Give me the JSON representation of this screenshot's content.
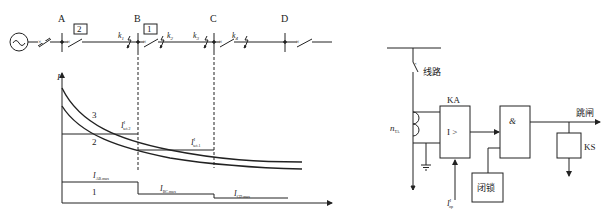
{
  "left_diagram": {
    "buses": [
      {
        "label": "A"
      },
      {
        "label": "B"
      },
      {
        "label": "C"
      },
      {
        "label": "D"
      }
    ],
    "protection_boxes": [
      {
        "label": "2"
      },
      {
        "label": "1"
      }
    ],
    "fault_points": [
      {
        "label": "k",
        "sub": "1"
      },
      {
        "label": "k",
        "sub": "2"
      },
      {
        "label": "k",
        "sub": "3"
      },
      {
        "label": "k",
        "sub": "4"
      }
    ],
    "source_symbol": "~",
    "y_axis_label": "I",
    "curves": [
      {
        "label": "3"
      },
      {
        "label": "2"
      },
      {
        "label": "1"
      }
    ],
    "settings": [
      {
        "label": "I",
        "sup": "I",
        "sub": "set.2"
      },
      {
        "label": "I",
        "sup": "I",
        "sub": "set.1"
      }
    ],
    "load_currents": [
      {
        "label": "I",
        "sub": "AB.max"
      },
      {
        "label": "I",
        "sub": "BC.max"
      },
      {
        "label": "I",
        "sub": "CD.max"
      }
    ]
  },
  "right_diagram": {
    "line_label": "线路",
    "ct_label": "n",
    "ct_sub": "TA",
    "relay_label": "KA",
    "relay_symbol": "I >",
    "and_symbol": "&",
    "trip_label": "跳闸",
    "signal_label": "KS",
    "block_label": "闭锁",
    "setting_label": "I",
    "setting_sup": "I",
    "setting_sub": "op"
  }
}
